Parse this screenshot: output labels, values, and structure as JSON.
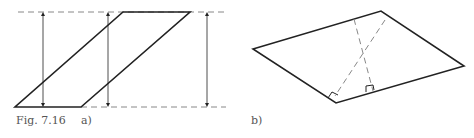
{
  "figure": {
    "caption_number": "Fig. 7.16",
    "panel_a_label": "a)",
    "panel_b_label": "b)"
  },
  "colors": {
    "stroke": "#222222",
    "dashed": "#888888",
    "text": "#555555"
  }
}
